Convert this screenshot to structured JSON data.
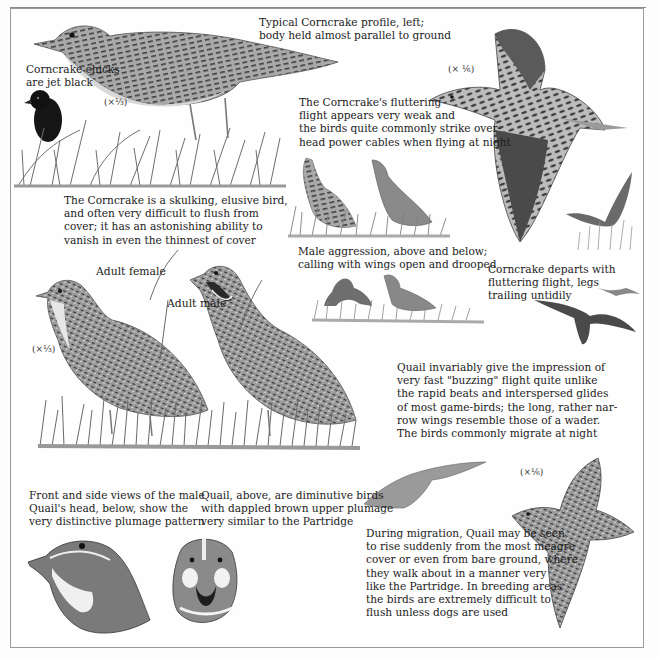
{
  "page": {
    "colors": {
      "paper": "#fdfdfd",
      "frame": "#9a9a9a",
      "text": "#1c1c1c",
      "ink_dark": "#3a3a3a",
      "ink_mid": "#7a7a7a",
      "ink_light": "#b5b5b5"
    }
  },
  "corncrake": {
    "profile_caption": "Typical Corncrake profile, left;\nbody held almost parallel to ground",
    "chicks_caption": "Corncrake chicks\nare jet black",
    "standing_scale": "(×¹⁄₃)",
    "skulking_caption": "The Corncrake is a skulking, elusive bird,\nand often very difficult to flush from\ncover; it has an astonishing ability to\nvanish in even the thinnest of cover",
    "flight_scale": "(× ¹⁄₆)",
    "flight_caption": "The Corncrake's fluttering\nflight appears very weak and\nthe birds quite commonly strike over-\nhead power cables when flying at night",
    "aggression_caption": "Male aggression, above and below;\ncalling with wings open and drooped",
    "departs_caption": "Corncrake departs with\nfluttering flight, legs\ntrailing untidily"
  },
  "quail": {
    "female_label": "Adult female",
    "male_label": "Adult male",
    "standing_scale": "(×¹⁄₃)",
    "buzzing_caption": "Quail invariably give the impression of\nvery fast \"buzzing\" flight quite unlike\nthe rapid beats and interspersed glides\nof most game-birds; the long, rather nar-\nrow wings resemble those of a wader.\nThe birds commonly migrate at night",
    "heads_caption": "Front and side views of the male\nQuail's head, below, show the\nvery distinctive plumage pattern",
    "diminutive_caption": "Quail, above, are diminutive birds\nwith dappled brown upper plumage\nvery similar to the Partridge",
    "flight_scale": "(×¹⁄₆)",
    "migration_caption": "During migration, Quail may be seen\nto rise suddenly from the most meagre\ncover or even from bare ground, where\nthey walk about in a manner very\nlike the Partridge. In breeding areas\nthe birds are extremely difficult to\nflush unless dogs are used"
  }
}
